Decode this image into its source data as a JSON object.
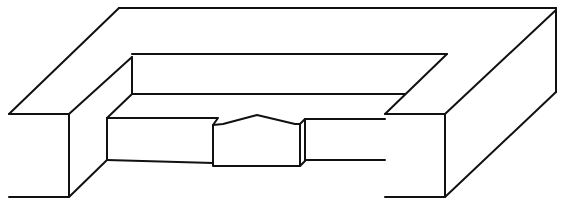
{
  "diagram": {
    "type": "isometric-line-drawing",
    "stroke_color": "#111111",
    "background": "#ffffff",
    "parts": [
      {
        "name": "left-front-face",
        "points": "9,114 69,114 69,197 9,197"
      },
      {
        "name": "left-top-diagonal",
        "points": "9,114 119,8"
      },
      {
        "name": "left-block-inner-top",
        "points": "69,114 132,57"
      },
      {
        "name": "left-block-side-bottom",
        "points": "69,197 107,160"
      },
      {
        "name": "outer-top-edge",
        "points": "119,8 556,8"
      },
      {
        "name": "outer-right-edge",
        "points": "556,8 556,92"
      },
      {
        "name": "right-bottom-diagonal",
        "points": "445,197 556,92"
      },
      {
        "name": "right-top-diagonal",
        "points": "445,114 556,10"
      },
      {
        "name": "right-front-face",
        "points": "385,114 445,114 445,197 385,197"
      },
      {
        "name": "inner-back-top",
        "points": "132,54 447,54"
      },
      {
        "name": "inner-left-vertical",
        "points": "132,57 132,94"
      },
      {
        "name": "inner-back-bottom",
        "points": "132,94 405,94"
      },
      {
        "name": "inner-right-diagonal",
        "points": "447,54 385,114"
      },
      {
        "name": "floor-left-diagonal",
        "points": "132,94 107,118"
      },
      {
        "name": "bar-left-face",
        "points": "107,118 218,118 213,125 213,163 107,160"
      },
      {
        "name": "bar-left-vertical",
        "points": "107,118 107,160"
      },
      {
        "name": "center-block",
        "points": "213,125 223,124 257,115 295,124 300,124 300,166 213,166 213,125"
      },
      {
        "name": "center-block-side",
        "points": "300,124 305,119 305,161 300,166"
      },
      {
        "name": "bar-right-face",
        "points": "305,119 385,119"
      },
      {
        "name": "bar-right-bottom",
        "points": "305,160 385,160"
      }
    ]
  }
}
